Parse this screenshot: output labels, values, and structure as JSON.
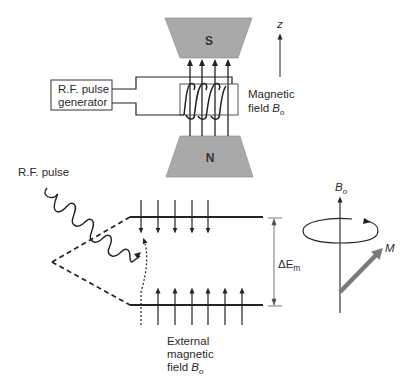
{
  "magnet": {
    "top_pole": "S",
    "bottom_pole": "N",
    "pole_fill": "#a9a9a9",
    "axis_label": "z"
  },
  "generator": {
    "line1": "R.F. pulse",
    "line2": "generator"
  },
  "field_label": {
    "line1": "Magnetic",
    "line2_prefix": "field ",
    "symbol": "B",
    "subscript": "o"
  },
  "energy_diagram": {
    "pulse_label": "R.F. pulse",
    "gap_symbol": "ΔE",
    "gap_subscript": "m",
    "external_label": {
      "line1": "External",
      "line2": "magnetic",
      "line3_prefix": "field ",
      "symbol": "B",
      "subscript": "o"
    },
    "upper_level_spins": 5,
    "lower_level_spins": 7
  },
  "precession": {
    "axis_symbol": "B",
    "axis_subscript": "o",
    "vector_label": "M",
    "vector_color": "#7a7a7a"
  }
}
